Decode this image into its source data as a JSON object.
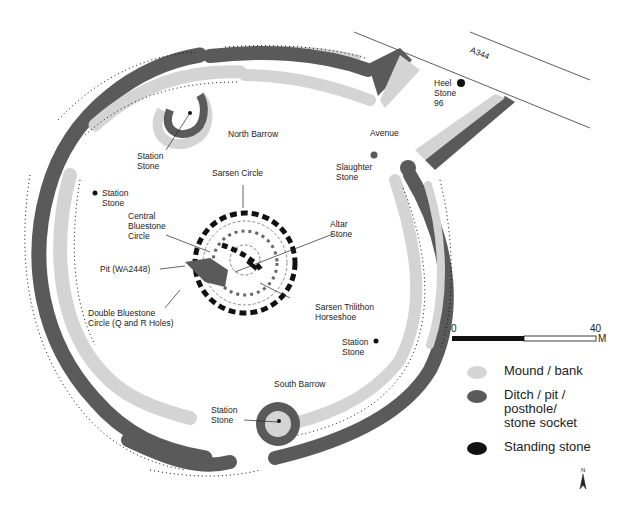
{
  "map": {
    "title": "Stonehenge site plan",
    "colors": {
      "mound": "#d4d4d4",
      "ditch": "#5a5a5a",
      "stone": "#111111",
      "background": "#ffffff"
    },
    "road_label": "A344",
    "labels": {
      "heel_stone": "Heel\nStone\n96",
      "north_barrow": "North Barrow",
      "station_stone_nw": "Station\nStone",
      "station_stone_w": "Station\nStone",
      "sarsen_circle": "Sarsen Circle",
      "central_bluestone": "Central\nBluestone\nCircle",
      "altar_stone": "Altar\nStone",
      "pit": "Pit (WA2448)",
      "double_bluestone": "Double Bluestone\nCircle (Q and R Holes)",
      "sarsen_trilithon": "Sarsen Trilithon\nHorseshoe",
      "avenue": "Avenue",
      "slaughter_stone": "Slaughter\nStone",
      "station_stone_se": "Station\nStone",
      "south_barrow": "South Barrow",
      "station_stone_s": "Station\nStone"
    }
  },
  "scale_bar": {
    "start": "0",
    "end": "40",
    "unit": "M"
  },
  "legend": [
    {
      "label": "Mound / bank",
      "color": "#d4d4d4"
    },
    {
      "label": "Ditch / pit /\nposthole/\nstone socket",
      "color": "#5a5a5a"
    },
    {
      "label": "Standing stone",
      "color": "#111111"
    }
  ],
  "north_arrow": {
    "label": "N"
  }
}
